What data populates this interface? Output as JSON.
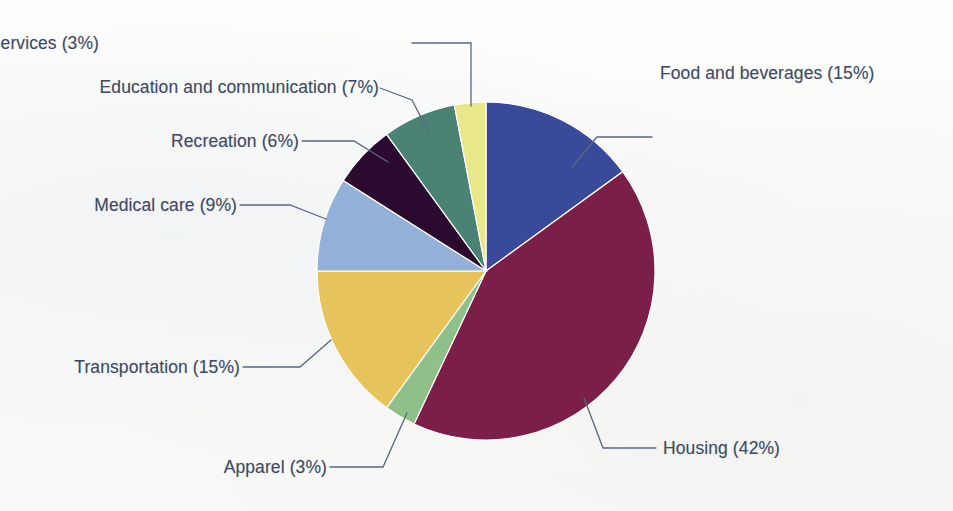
{
  "chart_data": {
    "type": "pie",
    "title": "",
    "subtitle": "",
    "xlabel": "",
    "ylabel": "",
    "units": "percent",
    "legend_position": "callout-labels",
    "grid": false,
    "total": 100,
    "categories": [
      "Food and beverages",
      "Housing",
      "Apparel",
      "Transportation",
      "Medical care",
      "Recreation",
      "Education and communication",
      "Other goods and services"
    ],
    "values": [
      15,
      42,
      3,
      15,
      9,
      6,
      7,
      3
    ],
    "colors": [
      "#3a4a9a",
      "#7b1f48",
      "#8fc08a",
      "#e7c35c",
      "#93b0d8",
      "#2a0a2e",
      "#4a8374",
      "#e8e88a"
    ],
    "slices": [
      {
        "label": "Food and beverages",
        "value": 15,
        "display": "Food and beverages (15%)",
        "color": "#3a4a9a"
      },
      {
        "label": "Housing",
        "value": 42,
        "display": "Housing (42%)",
        "color": "#7b1f48"
      },
      {
        "label": "Apparel",
        "value": 3,
        "display": "Apparel (3%)",
        "color": "#8fc08a"
      },
      {
        "label": "Transportation",
        "value": 15,
        "display": "Transportation (15%)",
        "color": "#e7c35c"
      },
      {
        "label": "Medical care",
        "value": 9,
        "display": "Medical care (9%)",
        "color": "#93b0d8"
      },
      {
        "label": "Recreation",
        "value": 6,
        "display": "Recreation (6%)",
        "color": "#2a0a2e"
      },
      {
        "label": "Education and communication",
        "value": 7,
        "display": "Education and communication (7%)",
        "color": "#4a8374"
      },
      {
        "label": "Other goods and services",
        "value": 3,
        "display": "Other goods and services (3%)",
        "color": "#e8e88a"
      }
    ]
  },
  "labels": {
    "food_and_beverages": "Food and beverages (15%)",
    "housing": "Housing (42%)",
    "apparel": "Apparel (3%)",
    "transportation": "Transportation (15%)",
    "medical_care": "Medical care (9%)",
    "recreation": "Recreation (6%)",
    "education_and_communication": "Education and communication (7%)",
    "other_goods_and_services": "Other goods and services (3%)"
  },
  "style": {
    "label_color": "#3f4a63",
    "leader_line_color": "#5a6781",
    "background": "#fdfdfb"
  }
}
